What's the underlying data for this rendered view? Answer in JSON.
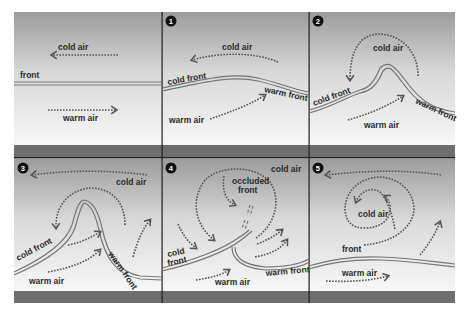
{
  "diagram": {
    "colors": {
      "sky_top": "#9e9e9e",
      "sky_bottom": "#f6f6f6",
      "ground_strip": "#6d6d6d",
      "divider": "#1e1e1e",
      "badge": "#111111",
      "arrow": "#5a5a5a",
      "front_line": "#6a6a6a"
    },
    "panels": [
      {
        "id": 0,
        "badge": "",
        "labels": {
          "cold_air": "cold air",
          "front": "front",
          "warm_air": "warm air"
        }
      },
      {
        "id": 1,
        "badge": "1",
        "labels": {
          "cold_air": "cold air",
          "cold_front": "cold front",
          "warm_front": "warm front",
          "warm_air": "warm air"
        }
      },
      {
        "id": 2,
        "badge": "2",
        "labels": {
          "cold_air": "cold air",
          "cold_front": "cold front",
          "warm_front": "warm front",
          "warm_air": "warm air"
        }
      },
      {
        "id": 3,
        "badge": "3",
        "labels": {
          "cold_air": "cold air",
          "cold_front": "cold front",
          "warm_front": "warm front",
          "warm_air": "warm air"
        }
      },
      {
        "id": 4,
        "badge": "4",
        "labels": {
          "cold_air": "cold air",
          "occluded_front_1": "occluded",
          "occluded_front_2": "front",
          "cold_front_1": "cold",
          "cold_front_2": "front",
          "warm_front": "warm front",
          "warm_air": "warm air"
        }
      },
      {
        "id": 5,
        "badge": "5",
        "labels": {
          "cold_air": "cold air",
          "front": "front",
          "warm_air": "warm air"
        }
      }
    ]
  }
}
